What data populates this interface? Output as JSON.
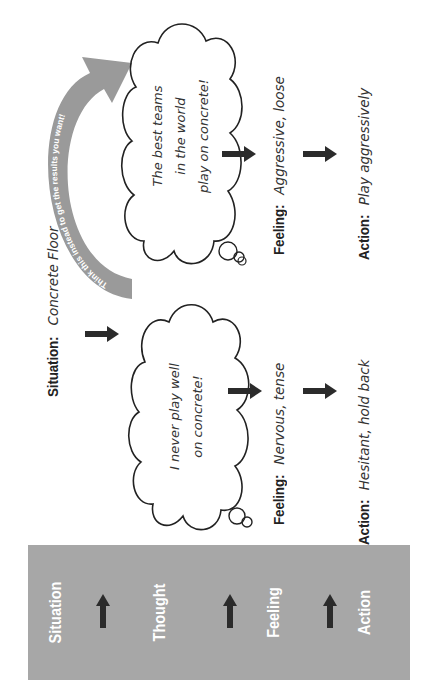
{
  "panel": {
    "items": [
      {
        "label": "Situation"
      },
      {
        "label": "Thought"
      },
      {
        "label": "Feeling"
      },
      {
        "label": "Action"
      }
    ],
    "background": "#a7a7a7",
    "text_color": "#ffffff"
  },
  "scenario_negative": {
    "situation_label": "Situation:",
    "situation_value": "Concrete Floor",
    "thought": [
      "I never play well",
      "on concrete!"
    ],
    "feeling_label": "Feeling:",
    "feeling_value": "Nervous, tense",
    "action_label": "Action:",
    "action_value": "Hesitant, hold back"
  },
  "scenario_positive": {
    "thought": [
      "The best teams",
      "in the world",
      "play on concrete!"
    ],
    "feeling_label": "Feeling:",
    "feeling_value": "Aggressive, loose",
    "action_label": "Action:",
    "action_value": "Play aggressively"
  },
  "reframe_arrow": {
    "label": "Think this instead to get the results you want!",
    "color": "#9a9a9a"
  },
  "colors": {
    "arrow": "#2b2b2b",
    "text": "#222222",
    "cloud_stroke": "#222222"
  }
}
